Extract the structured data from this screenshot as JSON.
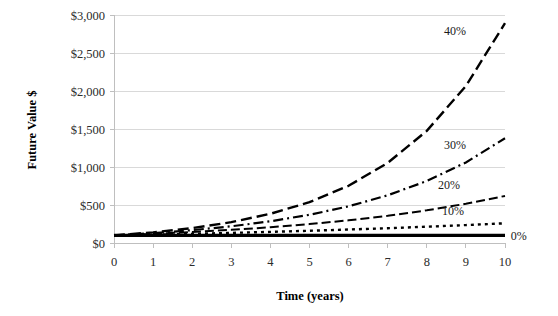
{
  "chart_data": {
    "type": "line",
    "title": "",
    "xlabel": "Time (years)",
    "ylabel": "Future Value $",
    "x": [
      0,
      1,
      2,
      3,
      4,
      5,
      6,
      7,
      8,
      9,
      10
    ],
    "xticks": [
      "0",
      "1",
      "2",
      "3",
      "4",
      "5",
      "6",
      "7",
      "8",
      "9",
      "10"
    ],
    "yticks": [
      "$0",
      "$500",
      "$1,000",
      "$1,500",
      "$2,000",
      "$2,500",
      "$3,000"
    ],
    "ytick_values": [
      0,
      500,
      1000,
      1500,
      2000,
      2500,
      3000
    ],
    "xlim": [
      0,
      10
    ],
    "ylim": [
      0,
      3000
    ],
    "grid": "horizontal",
    "legend": "inline-right-labels",
    "principal": 100,
    "series": [
      {
        "name": "40%",
        "label": "40%",
        "rate": 0.4,
        "linestyle": "long-dash",
        "dasharray": "11,5",
        "linewidth": 2.4,
        "color": "#000000",
        "values": [
          100,
          140,
          196,
          274.4,
          384.2,
          537.8,
          752.9,
          1054.1,
          1475.8,
          2066.1,
          2892.5
        ],
        "label_x": 9.0,
        "label_y": 2790
      },
      {
        "name": "30%",
        "label": "30%",
        "rate": 0.3,
        "linestyle": "dash-dot",
        "dasharray": "10,4,2,4",
        "linewidth": 2.2,
        "color": "#000000",
        "values": [
          100,
          130,
          169,
          219.7,
          285.6,
          371.3,
          482.7,
          627.5,
          815.7,
          1060.4,
          1378.6
        ],
        "label_x": 9.0,
        "label_y": 1290
      },
      {
        "name": "20%",
        "label": "20%",
        "rate": 0.2,
        "linestyle": "dash",
        "dasharray": "9,4",
        "linewidth": 2.0,
        "color": "#000000",
        "values": [
          100,
          120,
          144,
          172.8,
          207.4,
          248.8,
          298.6,
          358.3,
          430,
          516,
          619.2
        ],
        "label_x": 8.85,
        "label_y": 760
      },
      {
        "name": "10%",
        "label": "10%",
        "rate": 0.1,
        "linestyle": "dotted",
        "dasharray": "3,4",
        "linewidth": 2.4,
        "color": "#000000",
        "values": [
          100,
          110,
          121,
          133.1,
          146.4,
          161.1,
          177.2,
          194.9,
          214.4,
          235.8,
          259.4
        ],
        "label_x": 8.95,
        "label_y": 425
      },
      {
        "name": "0%",
        "label": "0%",
        "rate": 0.0,
        "linestyle": "solid",
        "dasharray": "",
        "linewidth": 3.2,
        "color": "#000000",
        "values": [
          100,
          100,
          100,
          100,
          100,
          100,
          100,
          100,
          100,
          100,
          100
        ],
        "label_x": 10.15,
        "label_y": 95
      }
    ]
  }
}
